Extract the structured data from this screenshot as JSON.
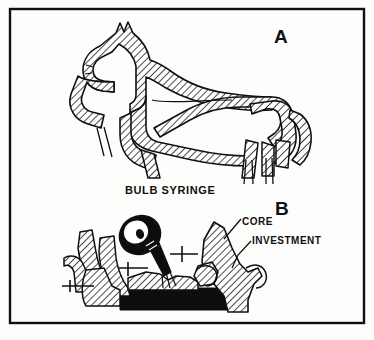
{
  "figure": {
    "type": "line-drawing",
    "background_color": "#fdfdfb",
    "ink_color": "#101010",
    "frame": {
      "name": "outer-border",
      "color": "#101010",
      "x": 10,
      "y": 9,
      "width": 354,
      "height": 314,
      "stroke_width": 2.4
    },
    "panels": [
      {
        "id": "A",
        "letter": "A",
        "subject": "horse-shaped wax pattern with sprue channels",
        "fill_style": "diagonal-hatching"
      },
      {
        "id": "B",
        "letter": "B",
        "subject": "bulb syringe applying investment over core on black base",
        "fill_style": "diagonal-hatching"
      }
    ],
    "labels": [
      {
        "name": "panel-a-letter",
        "text": "A",
        "x": 274,
        "y": 26,
        "font_size": 19,
        "bold": true
      },
      {
        "name": "panel-b-letter",
        "text": "B",
        "x": 275,
        "y": 198,
        "font_size": 19,
        "bold": true
      },
      {
        "name": "bulb-syringe-label",
        "text": "BULB SYRINGE",
        "x": 125,
        "y": 184,
        "font_size": 11,
        "bold": true
      },
      {
        "name": "core-label",
        "text": "CORE",
        "x": 242,
        "y": 216,
        "font_size": 10,
        "bold": true,
        "leader_line": true
      },
      {
        "name": "investment-label",
        "text": "INVESTMENT",
        "x": 252,
        "y": 235,
        "font_size": 10,
        "bold": true,
        "leader_line": true
      }
    ],
    "elements": {
      "base_slab": {
        "name": "black-base-slab",
        "color": "#0d0d0d"
      },
      "bulb": {
        "name": "syringe-bulb",
        "color": "#0d0d0d",
        "highlight_color": "#ffffff"
      },
      "hatching": {
        "angle_degrees": 45,
        "spacing_px": 4,
        "stroke_width": 1
      }
    }
  }
}
